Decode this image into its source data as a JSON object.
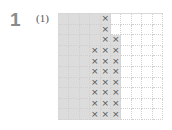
{
  "problem": {
    "number": "1",
    "sub_label": "(1)"
  },
  "grid": {
    "rows": 10,
    "cols": 10,
    "shade_color": "#dcdcdc",
    "mark_symbol": "×",
    "shaded_cells": [
      [
        0,
        0
      ],
      [
        0,
        1
      ],
      [
        0,
        2
      ],
      [
        0,
        3
      ],
      [
        0,
        4
      ],
      [
        1,
        0
      ],
      [
        1,
        1
      ],
      [
        1,
        2
      ],
      [
        1,
        3
      ],
      [
        1,
        4
      ],
      [
        2,
        0
      ],
      [
        2,
        1
      ],
      [
        2,
        2
      ],
      [
        2,
        3
      ],
      [
        2,
        4
      ],
      [
        2,
        5
      ],
      [
        3,
        0
      ],
      [
        3,
        1
      ],
      [
        3,
        2
      ],
      [
        3,
        3
      ],
      [
        3,
        4
      ],
      [
        3,
        5
      ],
      [
        4,
        0
      ],
      [
        4,
        1
      ],
      [
        4,
        2
      ],
      [
        4,
        3
      ],
      [
        4,
        4
      ],
      [
        4,
        5
      ],
      [
        5,
        0
      ],
      [
        5,
        1
      ],
      [
        5,
        2
      ],
      [
        5,
        3
      ],
      [
        5,
        4
      ],
      [
        5,
        5
      ],
      [
        6,
        0
      ],
      [
        6,
        1
      ],
      [
        6,
        2
      ],
      [
        6,
        3
      ],
      [
        6,
        4
      ],
      [
        6,
        5
      ],
      [
        7,
        0
      ],
      [
        7,
        1
      ],
      [
        7,
        2
      ],
      [
        7,
        3
      ],
      [
        7,
        4
      ],
      [
        7,
        5
      ],
      [
        8,
        0
      ],
      [
        8,
        1
      ],
      [
        8,
        2
      ],
      [
        8,
        3
      ],
      [
        8,
        4
      ],
      [
        8,
        5
      ],
      [
        9,
        0
      ],
      [
        9,
        1
      ],
      [
        9,
        2
      ],
      [
        9,
        3
      ],
      [
        9,
        4
      ],
      [
        9,
        5
      ]
    ],
    "marked_cells": [
      [
        0,
        4
      ],
      [
        1,
        4
      ],
      [
        2,
        4
      ],
      [
        2,
        5
      ],
      [
        3,
        3
      ],
      [
        3,
        4
      ],
      [
        3,
        5
      ],
      [
        4,
        3
      ],
      [
        4,
        4
      ],
      [
        4,
        5
      ],
      [
        5,
        3
      ],
      [
        5,
        4
      ],
      [
        5,
        5
      ],
      [
        6,
        3
      ],
      [
        6,
        4
      ],
      [
        6,
        5
      ],
      [
        7,
        3
      ],
      [
        7,
        4
      ],
      [
        7,
        5
      ],
      [
        8,
        3
      ],
      [
        8,
        4
      ],
      [
        8,
        5
      ],
      [
        9,
        3
      ],
      [
        9,
        4
      ],
      [
        9,
        5
      ]
    ]
  }
}
